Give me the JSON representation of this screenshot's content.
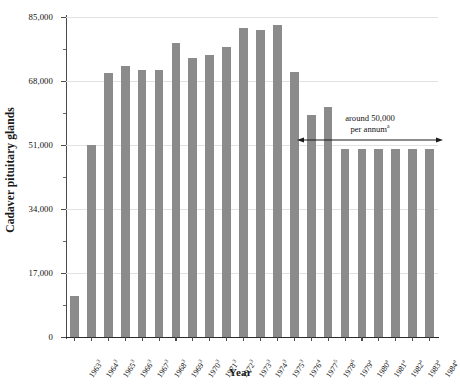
{
  "chart_data": {
    "type": "bar",
    "title": "",
    "xlabel": "Year",
    "ylabel": "Cadaver pituitary glands",
    "ylim": [
      0,
      85000
    ],
    "grid": true,
    "legend": "none",
    "categories": [
      "1963",
      "1964",
      "1965",
      "1966",
      "1967",
      "1968",
      "1969",
      "1970",
      "1971",
      "1972",
      "1973",
      "1974",
      "1975",
      "1976",
      "1977",
      "1978",
      "1979",
      "1980",
      "1981",
      "1982",
      "1983",
      "1984"
    ],
    "category_superscripts": [
      "3",
      "3",
      "3",
      "3",
      "3",
      "3",
      "3",
      "3",
      "3",
      "3",
      "3",
      "3",
      "3",
      "4",
      "5",
      "6",
      "a",
      "a",
      "a",
      "a",
      "a",
      "a"
    ],
    "values": [
      11000,
      51000,
      70000,
      72000,
      71000,
      71000,
      78000,
      74000,
      75000,
      77000,
      82000,
      81500,
      83000,
      70500,
      59000,
      61000,
      50000,
      50000,
      50000,
      50000,
      50000,
      50000
    ],
    "ytick_labels": [
      "0",
      "17,000",
      "34,000",
      "51,000",
      "68,000",
      "85,000"
    ],
    "ytick_values": [
      0,
      17000,
      34000,
      51000,
      68000,
      85000
    ],
    "yminor_values": [
      8500,
      25500,
      42500,
      59500,
      76500
    ],
    "bar_color": "#8b8b8b",
    "grid_color": "#e2e2e2",
    "axis_color": "#4a4a4a",
    "annotation": {
      "line1": "around 50,000",
      "line2": "per annum",
      "superscript": "a",
      "arrow_start_category": "1979",
      "arrow_end_category": "1984",
      "arrow_value": 53000
    }
  }
}
